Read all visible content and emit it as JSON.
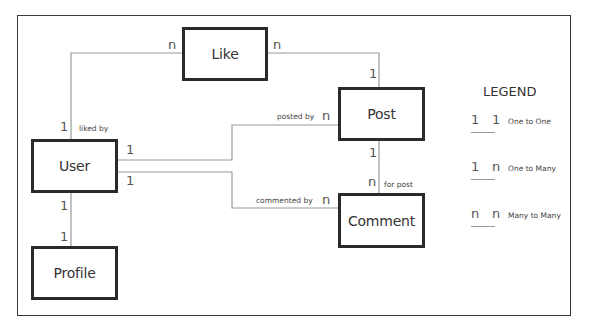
{
  "diagram": {
    "type": "entity-relationship",
    "entities": [
      {
        "id": "like",
        "label": "Like"
      },
      {
        "id": "post",
        "label": "Post"
      },
      {
        "id": "user",
        "label": "User"
      },
      {
        "id": "comment",
        "label": "Comment"
      },
      {
        "id": "profile",
        "label": "Profile"
      }
    ],
    "relationships": [
      {
        "from": "user",
        "to": "like",
        "from_card": "1",
        "to_card": "n",
        "label": "liked by"
      },
      {
        "from": "like",
        "to": "post",
        "from_card": "n",
        "to_card": "1",
        "label": ""
      },
      {
        "from": "user",
        "to": "post",
        "from_card": "1",
        "to_card": "n",
        "label": "posted by"
      },
      {
        "from": "user",
        "to": "comment",
        "from_card": "1",
        "to_card": "n",
        "label": "commented by"
      },
      {
        "from": "post",
        "to": "comment",
        "from_card": "1",
        "to_card": "n",
        "label": "for post"
      },
      {
        "from": "user",
        "to": "profile",
        "from_card": "1",
        "to_card": "1",
        "label": ""
      }
    ]
  },
  "legend": {
    "title": "LEGEND",
    "items": [
      {
        "left": "1",
        "right": "1",
        "text": "One to One"
      },
      {
        "left": "1",
        "right": "n",
        "text": "One to Many"
      },
      {
        "left": "n",
        "right": "n",
        "text": "Many to Many"
      }
    ]
  }
}
